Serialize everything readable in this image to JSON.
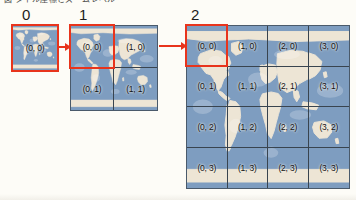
{
  "figure": {
    "cut_caption": "図 タイル座標とズームレベル",
    "accent_color": "#e8341c",
    "ocean_color": "#7e9dc0",
    "land_color": "#ede5d5",
    "gridline_color": "#39444f"
  },
  "levels": [
    {
      "label": "0",
      "cols": 1,
      "rows": 1,
      "tiles": [
        {
          "coord": "(0, 0)",
          "x": 0,
          "y": 0,
          "highlighted": true
        }
      ]
    },
    {
      "label": "1",
      "cols": 2,
      "rows": 2,
      "tiles": [
        {
          "coord": "(0, 0)",
          "x": 0,
          "y": 0,
          "highlighted": true
        },
        {
          "coord": "(1, 0)",
          "x": 1,
          "y": 0,
          "highlighted": false
        },
        {
          "coord": "(0, 1)",
          "x": 0,
          "y": 1,
          "highlighted": false
        },
        {
          "coord": "(1, 1)",
          "x": 1,
          "y": 1,
          "highlighted": false
        }
      ]
    },
    {
      "label": "2",
      "cols": 4,
      "rows": 4,
      "tiles": [
        {
          "coord": "(0, 0)",
          "x": 0,
          "y": 0,
          "highlighted": true
        },
        {
          "coord": "(1, 0)",
          "x": 1,
          "y": 0,
          "highlighted": false
        },
        {
          "coord": "(2, 0)",
          "x": 2,
          "y": 0,
          "highlighted": false
        },
        {
          "coord": "(3, 0)",
          "x": 3,
          "y": 0,
          "highlighted": false
        },
        {
          "coord": "(0, 1)",
          "x": 0,
          "y": 1,
          "highlighted": false
        },
        {
          "coord": "(1, 1)",
          "x": 1,
          "y": 1,
          "highlighted": false
        },
        {
          "coord": "(2, 1)",
          "x": 2,
          "y": 1,
          "highlighted": false
        },
        {
          "coord": "(3, 1)",
          "x": 3,
          "y": 1,
          "highlighted": false
        },
        {
          "coord": "(0, 2)",
          "x": 0,
          "y": 2,
          "highlighted": false
        },
        {
          "coord": "(1, 2)",
          "x": 1,
          "y": 2,
          "highlighted": false
        },
        {
          "coord": "(2, 2)",
          "x": 2,
          "y": 2,
          "highlighted": false
        },
        {
          "coord": "(3, 2)",
          "x": 3,
          "y": 2,
          "highlighted": false
        },
        {
          "coord": "(0, 3)",
          "x": 0,
          "y": 3,
          "highlighted": false
        },
        {
          "coord": "(1, 3)",
          "x": 1,
          "y": 3,
          "highlighted": false
        },
        {
          "coord": "(2, 3)",
          "x": 2,
          "y": 3,
          "highlighted": false
        },
        {
          "coord": "(3, 3)",
          "x": 3,
          "y": 3,
          "highlighted": false
        }
      ]
    }
  ],
  "arrows": [
    {
      "from": "0",
      "to": "1"
    },
    {
      "from": "1",
      "to": "2"
    }
  ]
}
